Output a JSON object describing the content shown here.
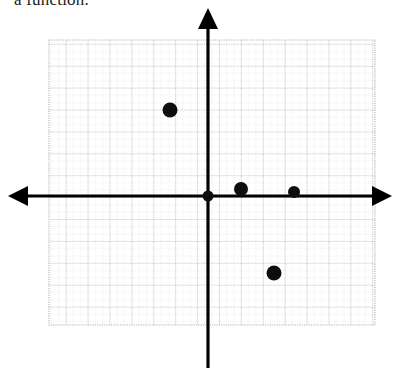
{
  "prompt": {
    "text": "a function."
  },
  "graph": {
    "axis_color": "#000000",
    "grid_minor_color": "#d2d2d2",
    "grid_major_color": "#b4b4b4",
    "point_color": "#0d0d0d",
    "grid_rect": {
      "x": 49,
      "y": 40,
      "width": 326,
      "height": 285
    },
    "minor_step": 7.3,
    "major_step": 21.9,
    "origin": {
      "x": 208,
      "y": 196
    },
    "x_axis": {
      "x1": 8,
      "y1": 196,
      "x2": 392,
      "y2": 196
    },
    "y_axis": {
      "x1": 208,
      "y1": 8,
      "x2": 208,
      "y2": 368
    },
    "arrows": [
      "left",
      "right",
      "up"
    ]
  },
  "chart_data": {
    "type": "scatter",
    "title": "",
    "xlabel": "",
    "ylabel": "",
    "grid": true,
    "legend": "none",
    "xlim": [
      -22,
      25
    ],
    "ylim": [
      -23,
      25
    ],
    "series": [
      {
        "name": "plotted points",
        "points": [
          {
            "label": "A",
            "px": 170,
            "py": 110,
            "x": -5,
            "y": 12,
            "r": 7.5
          },
          {
            "label": "B",
            "px": 208,
            "py": 196,
            "x": 0,
            "y": 0,
            "r": 5.5
          },
          {
            "label": "C",
            "px": 241,
            "py": 189,
            "x": 4.5,
            "y": 1,
            "r": 7.0
          },
          {
            "label": "D",
            "px": 294,
            "py": 192,
            "x": 12,
            "y": 0.5,
            "r": 6.0
          },
          {
            "label": "E",
            "px": 274,
            "py": 273,
            "x": 9,
            "y": -10.5,
            "r": 7.5
          }
        ]
      }
    ]
  }
}
